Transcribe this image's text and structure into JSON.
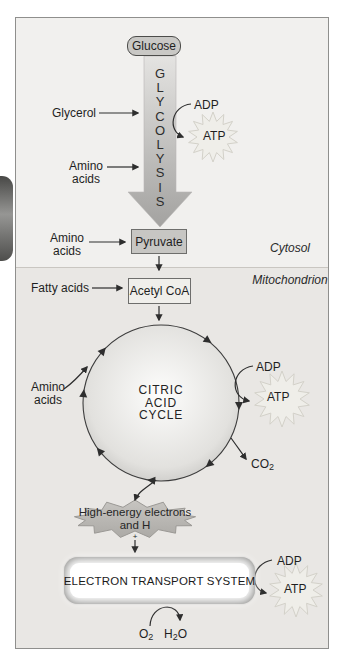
{
  "regions": {
    "cytosol": "Cytosol",
    "mitochondrion": "Mitochondrion"
  },
  "nodes": {
    "glucose": "Glucose",
    "glycolysis": [
      "G",
      "L",
      "Y",
      "C",
      "O",
      "L",
      "Y",
      "S",
      "I",
      "S"
    ],
    "pyruvate": "Pyruvate",
    "acetyl_coa": "Acetyl CoA",
    "citric_acid_cycle": [
      "CITRIC",
      "ACID",
      "CYCLE"
    ],
    "high_energy_burst": {
      "line1": "High-energy electrons",
      "line2_base": "and H",
      "line2_sup": "+"
    },
    "electron_transport": "ELECTRON TRANSPORT SYSTEM"
  },
  "inputs": {
    "glycerol": "Glycerol",
    "amino_acids": {
      "line1": "Amino",
      "line2": "acids"
    },
    "fatty_acids": "Fatty acids"
  },
  "energy": {
    "adp": "ADP",
    "atp": "ATP"
  },
  "molecules": {
    "co2": {
      "base": "CO",
      "sub": "2"
    },
    "o2": {
      "base": "O",
      "sub": "2"
    },
    "h2o": {
      "pre": "H",
      "sub": "2",
      "post": "O"
    }
  },
  "colors": {
    "panel_cytosol": "#f1f0ee",
    "panel_mitochondrion": "#e9e7e4",
    "box_gray": "#c7c6c3",
    "arrow_dark": "#2e2e2e",
    "burst_faint": "#efeee9",
    "burst_gray": "#bdbbb7"
  }
}
